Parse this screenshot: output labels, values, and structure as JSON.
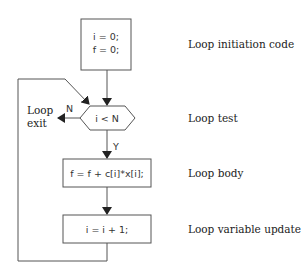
{
  "diagram": {
    "type": "flowchart",
    "nodes": {
      "init": {
        "line1": "i = 0;",
        "line2": "f = 0;"
      },
      "test": {
        "text": "i < N"
      },
      "body": {
        "text": "f = f + c[i]*x[i];"
      },
      "update": {
        "text": "i = i + 1;"
      }
    },
    "edges": {
      "no_label": "N",
      "yes_label": "Y",
      "exit_line1": "Loop",
      "exit_line2": "exit"
    },
    "annotations": {
      "init": "Loop initiation code",
      "test": "Loop test",
      "body": "Loop body",
      "update": "Loop variable update"
    },
    "colors": {
      "line": "#555555",
      "text": "#222222",
      "background": "#ffffff"
    }
  }
}
